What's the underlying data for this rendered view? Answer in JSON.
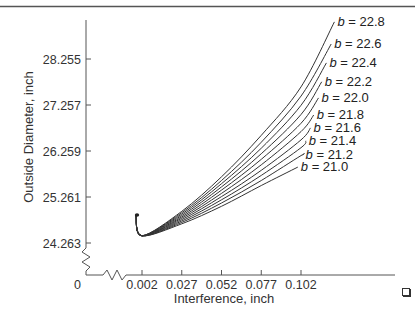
{
  "chart_data": {
    "type": "line",
    "title": "",
    "xlabel": "Interference, inch",
    "ylabel": "Outside Diameter, inch",
    "x_ticks": [
      "0.002",
      "0.027",
      "0.052",
      "0.077",
      "0.102"
    ],
    "x_tick_values": [
      0.002,
      0.027,
      0.052,
      0.077,
      0.102
    ],
    "y_ticks": [
      "24.263",
      "25.261",
      "26.259",
      "27.257",
      "28.255"
    ],
    "y_tick_values": [
      24.263,
      25.261,
      26.259,
      27.257,
      28.255
    ],
    "origin_label": "0",
    "axis_breaks": {
      "x": true,
      "y": true
    },
    "xlim": [
      0,
      0.125
    ],
    "ylim": [
      0,
      29.1
    ],
    "grid": false,
    "legend_position": "inline labels at line ends (upper right)",
    "common_origin": {
      "x": 0.0,
      "y": 24.4
    },
    "series": [
      {
        "name": "b = 22.8",
        "b": 22.8,
        "x": [
          0.0,
          0.002,
          0.027,
          0.052,
          0.077,
          0.102,
          0.123
        ],
        "y": [
          24.4,
          24.42,
          24.95,
          25.7,
          26.6,
          27.65,
          29.06
        ]
      },
      {
        "name": "b = 22.6",
        "b": 22.6,
        "x": [
          0.0,
          0.002,
          0.027,
          0.052,
          0.077,
          0.102,
          0.121
        ],
        "y": [
          24.4,
          24.42,
          24.92,
          25.62,
          26.45,
          27.45,
          28.58
        ]
      },
      {
        "name": "b = 22.4",
        "b": 22.4,
        "x": [
          0.0,
          0.002,
          0.027,
          0.052,
          0.077,
          0.102,
          0.118
        ],
        "y": [
          24.4,
          24.42,
          24.89,
          25.55,
          26.32,
          27.25,
          28.17
        ]
      },
      {
        "name": "b = 22.2",
        "b": 22.2,
        "x": [
          0.0,
          0.002,
          0.027,
          0.052,
          0.077,
          0.102,
          0.115
        ],
        "y": [
          24.4,
          24.42,
          24.86,
          25.48,
          26.2,
          27.05,
          27.76
        ]
      },
      {
        "name": "b = 22.0",
        "b": 22.0,
        "x": [
          0.0,
          0.002,
          0.027,
          0.052,
          0.077,
          0.102,
          0.113
        ],
        "y": [
          24.4,
          24.42,
          24.83,
          25.41,
          26.08,
          26.86,
          27.41
        ]
      },
      {
        "name": "b = 21.8",
        "b": 21.8,
        "x": [
          0.0,
          0.002,
          0.027,
          0.052,
          0.077,
          0.102,
          0.11
        ],
        "y": [
          24.4,
          24.42,
          24.8,
          25.34,
          25.96,
          26.68,
          27.04
        ]
      },
      {
        "name": "b = 21.6",
        "b": 21.6,
        "x": [
          0.0,
          0.002,
          0.027,
          0.052,
          0.077,
          0.102,
          0.108
        ],
        "y": [
          24.4,
          24.42,
          24.77,
          25.27,
          25.84,
          26.5,
          26.76
        ]
      },
      {
        "name": "b = 21.4",
        "b": 21.4,
        "x": [
          0.0,
          0.002,
          0.027,
          0.052,
          0.077,
          0.102,
          0.105
        ],
        "y": [
          24.4,
          24.42,
          24.74,
          25.2,
          25.73,
          26.33,
          26.48
        ]
      },
      {
        "name": "b = 21.2",
        "b": 21.2,
        "x": [
          0.0,
          0.002,
          0.027,
          0.052,
          0.077,
          0.102,
          0.103
        ],
        "y": [
          24.4,
          24.42,
          24.71,
          25.13,
          25.62,
          26.16,
          26.17
        ]
      },
      {
        "name": "b = 21.0",
        "b": 21.0,
        "x": [
          0.0,
          0.002,
          0.027,
          0.052,
          0.077,
          0.1
        ],
        "y": [
          24.4,
          24.42,
          24.68,
          25.06,
          25.51,
          25.91
        ]
      }
    ]
  },
  "labels": {
    "xlabel": "Interference, inch",
    "ylabel": "Outside Diameter, inch",
    "origin": "0",
    "b_symbol": "b",
    "equals": " = "
  }
}
